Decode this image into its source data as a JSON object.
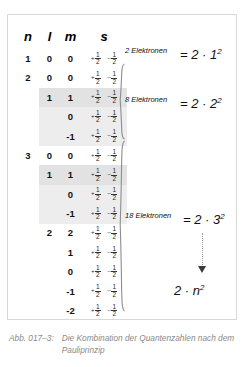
{
  "figure": {
    "caption_label": "Abb. 017–3:",
    "caption_text": "Die Kombination der Quantenzahlen nach dem Pauliprinzip",
    "border_color": "#d8d8d8",
    "highlight_color": "#e2e2e2",
    "caption_color": "#8a8a8a"
  },
  "table": {
    "headers": {
      "n": "n",
      "l": "l",
      "m": "m",
      "s": "s"
    },
    "spin_up": {
      "sign": "+",
      "num": "1",
      "den": "2"
    },
    "spin_down": {
      "sign": "–",
      "num": "1",
      "den": "2"
    },
    "rows": [
      {
        "n": "1",
        "l": "0",
        "m": "0"
      },
      {
        "n": "2",
        "l": "0",
        "m": "0"
      },
      {
        "n": "",
        "l": "1",
        "m": "1"
      },
      {
        "n": "",
        "l": "",
        "m": "0"
      },
      {
        "n": "",
        "l": "",
        "m": "-1"
      },
      {
        "n": "3",
        "l": "0",
        "m": "0"
      },
      {
        "n": "",
        "l": "1",
        "m": "1"
      },
      {
        "n": "",
        "l": "",
        "m": "0"
      },
      {
        "n": "",
        "l": "",
        "m": "-1"
      },
      {
        "n": "",
        "l": "2",
        "m": "2"
      },
      {
        "n": "",
        "l": "",
        "m": "1"
      },
      {
        "n": "",
        "l": "",
        "m": "0"
      },
      {
        "n": "",
        "l": "",
        "m": "-1"
      },
      {
        "n": "",
        "l": "",
        "m": "-2"
      }
    ]
  },
  "annotations": [
    {
      "label": "2 Elektronen",
      "formula_prefix": "= 2 · ",
      "formula_base": "1",
      "formula_exp": "2"
    },
    {
      "label": "8 Elektronen",
      "formula_prefix": "= 2 · ",
      "formula_base": "2",
      "formula_exp": "2"
    },
    {
      "label": "18 Elektronen",
      "formula_prefix": "= 2 · ",
      "formula_base": "3",
      "formula_exp": "2"
    }
  ],
  "general_formula": {
    "prefix": "2 · ",
    "base": "n",
    "exp": "2"
  }
}
